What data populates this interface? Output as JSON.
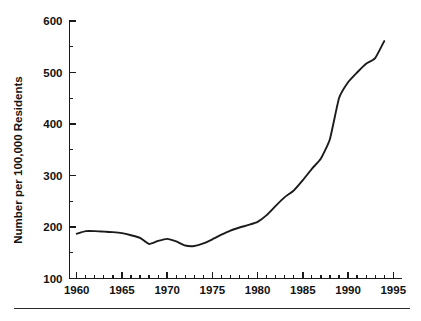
{
  "chart_data": {
    "type": "line",
    "title": "",
    "subtitle": "",
    "xlabel": "",
    "ylabel": "Number per 100,000 Residents",
    "xlim": [
      1959.2,
      1995.8
    ],
    "ylim": [
      100,
      600
    ],
    "grid": false,
    "legend": null,
    "x_tick_labels": [
      "1960",
      "1965",
      "1970",
      "1975",
      "1980",
      "1985",
      "1990",
      "1995"
    ],
    "x_ticks": [
      1960,
      1965,
      1970,
      1975,
      1980,
      1985,
      1990,
      1995
    ],
    "x_minor_tick_interval": 1,
    "y_tick_labels": [
      "100",
      "200",
      "300",
      "400",
      "500",
      "600"
    ],
    "y_ticks": [
      100,
      200,
      300,
      400,
      500,
      600
    ],
    "y_minor_tick_interval": 50,
    "series": [
      {
        "name": "Rate per 100,000 residents",
        "color": "#1b1b1b",
        "x": [
          1960,
          1961,
          1962,
          1963,
          1964,
          1965,
          1966,
          1967,
          1968,
          1969,
          1970,
          1971,
          1972,
          1973,
          1974,
          1975,
          1976,
          1977,
          1978,
          1979,
          1980,
          1981,
          1982,
          1983,
          1984,
          1985,
          1986,
          1987,
          1988,
          1989,
          1990,
          1991,
          1992,
          1993,
          1994
        ],
        "values": [
          187,
          192,
          192,
          191,
          190,
          188,
          184,
          179,
          167,
          173,
          177,
          172,
          164,
          163,
          168,
          176,
          185,
          193,
          199,
          204,
          210,
          223,
          241,
          258,
          271,
          291,
          313,
          333,
          371,
          450,
          481,
          500,
          517,
          528,
          561
        ]
      }
    ]
  },
  "axis": {
    "y_title": "Number per 100,000 Residents"
  },
  "footer": {
    "rule_visible": "true"
  }
}
